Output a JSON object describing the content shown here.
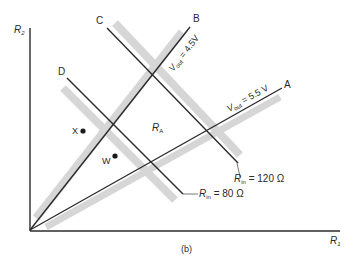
{
  "figure": {
    "caption": "(b)",
    "axes": {
      "x_label": "R",
      "x_label_sub": "1",
      "y_label": "R",
      "y_label_sub": "2"
    },
    "lines": {
      "A": {
        "label": "A",
        "annotation_main": "V",
        "annotation_sub": "out",
        "annotation_value": " = 5.5 V"
      },
      "B": {
        "label": "B",
        "annotation_main": "V",
        "annotation_sub": "out",
        "annotation_value": " = 4.5V"
      },
      "C": {
        "label": "C",
        "annotation_main": "R",
        "annotation_sub": "in",
        "annotation_value": " = 120 Ω"
      },
      "D": {
        "label": "D",
        "annotation_main": "R",
        "annotation_sub": "in",
        "annotation_value": " = 80 Ω"
      }
    },
    "region": {
      "main": "R",
      "sub": "A"
    },
    "points": [
      {
        "label": "X"
      },
      {
        "label": "W"
      }
    ],
    "colors": {
      "line": "#2b2b2b",
      "shade": "#d4d4d4",
      "background": "#ffffff"
    }
  }
}
